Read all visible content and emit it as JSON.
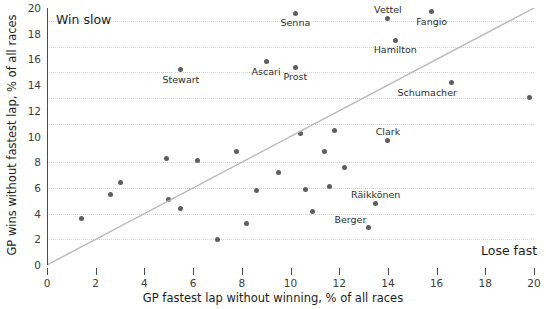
{
  "chart_data": {
    "type": "scatter",
    "title": "",
    "xlabel": "GP fastest lap without winning, % of all races",
    "ylabel": "GP wins without fastest lap, % of all races",
    "xlim": [
      0,
      20
    ],
    "ylim": [
      0,
      20
    ],
    "xticks": [
      0,
      2,
      4,
      6,
      8,
      10,
      12,
      14,
      16,
      18,
      20
    ],
    "yticks": [
      0,
      2,
      4,
      6,
      8,
      10,
      12,
      14,
      16,
      18,
      20
    ],
    "gridlines_y": [
      2,
      4,
      6,
      8,
      11,
      13,
      15,
      17,
      19
    ],
    "grid": "horizontal-dotted",
    "legend": "none",
    "reference_line": {
      "name": "y = x diagonal",
      "from": [
        0,
        0
      ],
      "to": [
        20,
        20
      ],
      "color": "#b9b9b9"
    },
    "annotations": [
      {
        "name": "win-slow",
        "text": "Win slow",
        "x": 0.4,
        "y": 19.0
      },
      {
        "name": "lose-fast",
        "text": "Lose fast",
        "x": 17.9,
        "y": 1.6
      }
    ],
    "point_color": "#5e5e5e",
    "points": [
      {
        "label": "Vettel",
        "x": 14.0,
        "y": 19.2,
        "label_pos": "above"
      },
      {
        "label": "Fangio",
        "x": 15.8,
        "y": 19.7,
        "label_pos": "below"
      },
      {
        "label": "Senna",
        "x": 10.2,
        "y": 19.6,
        "label_pos": "below"
      },
      {
        "label": "Hamilton",
        "x": 14.3,
        "y": 17.5,
        "label_pos": "below"
      },
      {
        "label": "Ascari",
        "x": 9.0,
        "y": 15.8,
        "label_pos": "below"
      },
      {
        "label": "Stewart",
        "x": 5.5,
        "y": 15.2,
        "label_pos": "below"
      },
      {
        "label": "Prost",
        "x": 10.2,
        "y": 15.4,
        "label_pos": "below"
      },
      {
        "label": "Schumacher",
        "x": 16.6,
        "y": 14.2,
        "label_pos": "below-left"
      },
      {
        "label": "",
        "x": 19.8,
        "y": 13.0,
        "label_pos": "none"
      },
      {
        "label": "Clark",
        "x": 14.0,
        "y": 9.7,
        "label_pos": "above"
      },
      {
        "label": "",
        "x": 11.8,
        "y": 10.5,
        "label_pos": "none"
      },
      {
        "label": "",
        "x": 10.4,
        "y": 10.2,
        "label_pos": "none"
      },
      {
        "label": "Räikkönen",
        "x": 13.5,
        "y": 4.8,
        "label_pos": "above"
      },
      {
        "label": "",
        "x": 7.8,
        "y": 8.8,
        "label_pos": "none"
      },
      {
        "label": "",
        "x": 11.4,
        "y": 8.8,
        "label_pos": "none"
      },
      {
        "label": "",
        "x": 4.9,
        "y": 8.3,
        "label_pos": "none"
      },
      {
        "label": "",
        "x": 6.2,
        "y": 8.1,
        "label_pos": "none"
      },
      {
        "label": "",
        "x": 12.2,
        "y": 7.6,
        "label_pos": "none"
      },
      {
        "label": "",
        "x": 9.5,
        "y": 7.2,
        "label_pos": "none"
      },
      {
        "label": "",
        "x": 3.0,
        "y": 6.4,
        "label_pos": "none"
      },
      {
        "label": "",
        "x": 11.6,
        "y": 6.1,
        "label_pos": "none"
      },
      {
        "label": "",
        "x": 10.6,
        "y": 5.9,
        "label_pos": "none"
      },
      {
        "label": "",
        "x": 8.6,
        "y": 5.8,
        "label_pos": "none"
      },
      {
        "label": "",
        "x": 2.6,
        "y": 5.5,
        "label_pos": "none"
      },
      {
        "label": "",
        "x": 5.0,
        "y": 5.1,
        "label_pos": "none"
      },
      {
        "label": "",
        "x": 5.5,
        "y": 4.4,
        "label_pos": "none"
      },
      {
        "label": "",
        "x": 10.9,
        "y": 4.2,
        "label_pos": "none"
      },
      {
        "label": "",
        "x": 1.4,
        "y": 3.6,
        "label_pos": "none"
      },
      {
        "label": "",
        "x": 8.2,
        "y": 3.2,
        "label_pos": "none"
      },
      {
        "label": "Berger",
        "x": 13.2,
        "y": 2.9,
        "label_pos": "above-left"
      },
      {
        "label": "",
        "x": 7.0,
        "y": 2.0,
        "label_pos": "none"
      }
    ]
  }
}
